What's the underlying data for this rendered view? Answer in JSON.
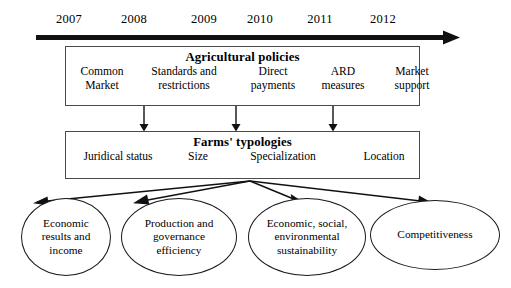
{
  "diagram": {
    "background_color": "#ffffff",
    "line_color": "#1a1a1a",
    "box_border_color": "#4a4a4a"
  },
  "timeline": {
    "years": [
      "2007",
      "2008",
      "2009",
      "2010",
      "2011",
      "2012"
    ],
    "arrow_direction": "right"
  },
  "policies": {
    "title": "Agricultural policies",
    "items": [
      "Common\nMarket",
      "Standards and\nrestrictions",
      "Direct\npayments",
      "ARD\nmeasures",
      "Market\nsupport"
    ]
  },
  "typologies": {
    "title": "Farms' typologies",
    "items": [
      "Juridical status",
      "Size",
      "Specialization",
      "Location"
    ]
  },
  "outcomes": [
    "Economic\nresults and\nincome",
    "Production and\ngovernance\nefficiency",
    "Economic, social,\nenvironmental\nsustainability",
    "Competitiveness"
  ]
}
